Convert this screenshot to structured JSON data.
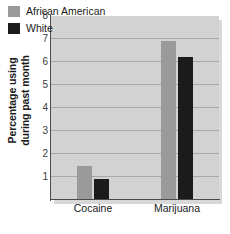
{
  "chart_data": {
    "type": "bar",
    "title": "",
    "subtitle": "",
    "xlabel": "",
    "ylabel": "Percentage using during past month",
    "ylabel_lines": [
      "Percentage using",
      "during past month"
    ],
    "categories": [
      "Cocaine",
      "Marijuana"
    ],
    "series": [
      {
        "name": "African American",
        "color": "#9a9a9a",
        "values": [
          1.5,
          6.9
        ]
      },
      {
        "name": "White",
        "color": "#1b1b1b",
        "values": [
          0.9,
          6.2
        ]
      }
    ],
    "ylim": [
      0,
      8
    ],
    "yticks": [
      1,
      2,
      3,
      4,
      5,
      6,
      7,
      8
    ],
    "ytick_labels": [
      "1",
      "2",
      "3",
      "4",
      "5",
      "6",
      "7",
      "8"
    ],
    "grid": true,
    "grid_axis": "y",
    "legend_position": "top-left-inside",
    "plot_background": "#d2d2d2",
    "figure_background": "#ffffff",
    "gridline_color": "#a8a8a8",
    "axis_color": "#4a4a4a"
  },
  "legend": {
    "entries": [
      {
        "label": "African American",
        "swatch": "#9a9a9a"
      },
      {
        "label": "White",
        "swatch": "#1b1b1b"
      }
    ]
  }
}
